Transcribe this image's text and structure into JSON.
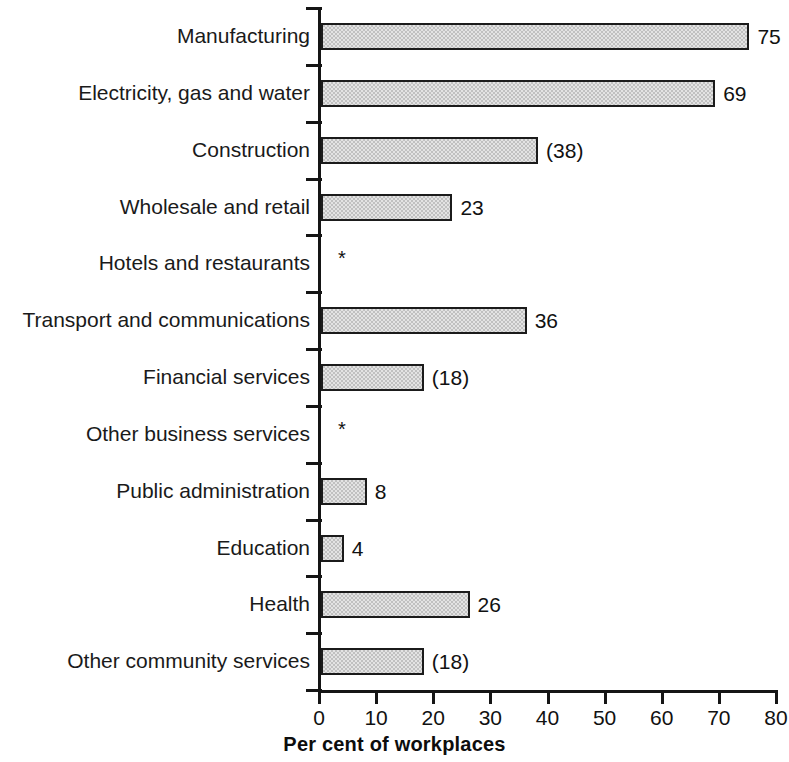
{
  "chart_data": {
    "type": "bar",
    "orientation": "horizontal",
    "title": "",
    "xlabel": "Per cent of workplaces",
    "ylabel": "",
    "xlim": [
      0,
      80
    ],
    "xticks": [
      0,
      10,
      20,
      30,
      40,
      50,
      60,
      70,
      80
    ],
    "grid": false,
    "legend": null,
    "suppressed_marker": "*",
    "categories": [
      "Manufacturing",
      "Electricity, gas and water",
      "Construction",
      "Wholesale and retail",
      "Hotels and restaurants",
      "Transport and communications",
      "Financial services",
      "Other business services",
      "Public administration",
      "Education",
      "Health",
      "Other community services"
    ],
    "values": [
      75,
      69,
      38,
      23,
      null,
      36,
      18,
      null,
      8,
      4,
      26,
      18
    ],
    "value_labels": [
      "75",
      "69",
      "(38)",
      "23",
      "*",
      "36",
      "(18)",
      "*",
      "8",
      "4",
      "26",
      "(18)"
    ],
    "bars": [
      {
        "category": "Manufacturing",
        "value": 75,
        "label": "75",
        "suppressed": false
      },
      {
        "category": "Electricity, gas and water",
        "value": 69,
        "label": "69",
        "suppressed": false
      },
      {
        "category": "Construction",
        "value": 38,
        "label": "(38)",
        "suppressed": false
      },
      {
        "category": "Wholesale and retail",
        "value": 23,
        "label": "23",
        "suppressed": false
      },
      {
        "category": "Hotels and restaurants",
        "value": null,
        "label": "*",
        "suppressed": true
      },
      {
        "category": "Transport and communications",
        "value": 36,
        "label": "36",
        "suppressed": false
      },
      {
        "category": "Financial services",
        "value": 18,
        "label": "(18)",
        "suppressed": false
      },
      {
        "category": "Other business services",
        "value": null,
        "label": "*",
        "suppressed": true
      },
      {
        "category": "Public administration",
        "value": 8,
        "label": "8",
        "suppressed": false
      },
      {
        "category": "Education",
        "value": 4,
        "label": "4",
        "suppressed": false
      },
      {
        "category": "Health",
        "value": 26,
        "label": "26",
        "suppressed": false
      },
      {
        "category": "Other community services",
        "value": 18,
        "label": "(18)",
        "suppressed": false
      }
    ],
    "colors": {
      "bar_fill": "#c0c0c0",
      "bar_edge": "#1b1b1b",
      "axis": "#151515",
      "text": "#111111",
      "background": "#ffffff"
    }
  }
}
